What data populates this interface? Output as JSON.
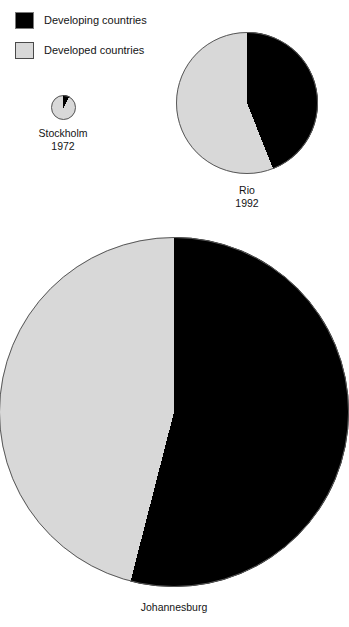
{
  "legend": {
    "items": [
      {
        "label": "Developing countries",
        "color": "#000000",
        "swatch": "developing"
      },
      {
        "label": "Developed countries",
        "color": "#d8d8d8",
        "swatch": "developed"
      }
    ]
  },
  "pies": {
    "stockholm": {
      "name": "Stockholm",
      "year": "1972"
    },
    "rio": {
      "name": "Rio",
      "year": "1992"
    },
    "johannesburg": {
      "name": "Johannesburg",
      "year": ""
    }
  },
  "chart_data": {
    "type": "pie",
    "title": "",
    "legend_position": "top-left",
    "series_names": [
      "Developing countries",
      "Developed countries"
    ],
    "series_colors": [
      "#000000",
      "#d8d8d8"
    ],
    "start_angle_deg": 0,
    "direction": "clockwise",
    "charts": [
      {
        "label": "Stockholm",
        "year": "1972",
        "relative_size_px": 25,
        "slices": [
          {
            "name": "Developing countries",
            "value": 8,
            "color": "#000000"
          },
          {
            "name": "Developed countries",
            "value": 92,
            "color": "#d8d8d8"
          }
        ]
      },
      {
        "label": "Rio",
        "year": "1992",
        "relative_size_px": 142,
        "slices": [
          {
            "name": "Developing countries",
            "value": 44,
            "color": "#000000"
          },
          {
            "name": "Developed countries",
            "value": 56,
            "color": "#d8d8d8"
          }
        ]
      },
      {
        "label": "Johannesburg",
        "year": "",
        "relative_size_px": 350,
        "slices": [
          {
            "name": "Developing countries",
            "value": 54,
            "color": "#000000"
          },
          {
            "name": "Developed countries",
            "value": 46,
            "color": "#d8d8d8"
          }
        ]
      }
    ]
  }
}
